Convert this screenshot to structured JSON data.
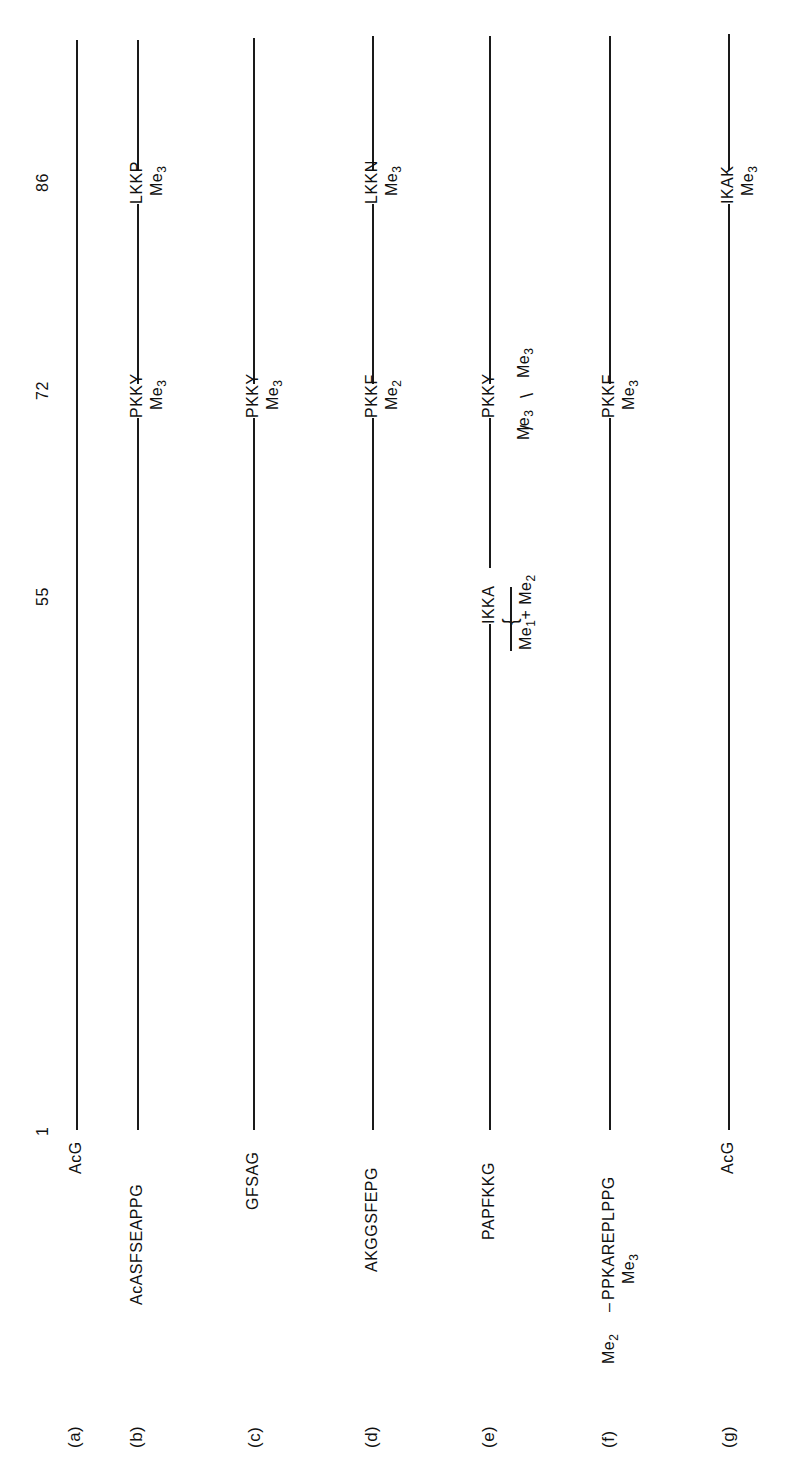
{
  "figure": {
    "positions": [
      {
        "label": "1",
        "y": 1128
      },
      {
        "label": "55",
        "y": 592
      },
      {
        "label": "72",
        "y": 386
      },
      {
        "label": "86",
        "y": 178
      }
    ],
    "rows": [
      {
        "id": "a",
        "label": "(a)",
        "n_term": "AcG",
        "x": 77,
        "sites": []
      },
      {
        "id": "b",
        "label": "(b)",
        "n_term": "AcASFSEAPPG",
        "x": 138,
        "sites": [
          {
            "pos": "72",
            "seq": "PKKY",
            "mod": "Me",
            "sub": "3"
          },
          {
            "pos": "86",
            "seq": "LKKP",
            "mod": "Me",
            "sub": "3"
          }
        ]
      },
      {
        "id": "c",
        "label": "(c)",
        "n_term": "GFSAG",
        "x": 254,
        "sites": [
          {
            "pos": "72",
            "seq": "PKKY",
            "mod": "Me",
            "sub": "3"
          }
        ]
      },
      {
        "id": "d",
        "label": "(d)",
        "n_term": "AKGGSFEPG",
        "x": 373,
        "sites": [
          {
            "pos": "72",
            "seq": "PKKF",
            "mod": "Me",
            "sub": "2"
          },
          {
            "pos": "86",
            "seq": "LKKN",
            "mod": "Me",
            "sub": "3"
          }
        ]
      },
      {
        "id": "e",
        "label": "(e)",
        "n_term": "PAPFKKG",
        "x": 490,
        "sites": [
          {
            "pos": "55",
            "seq": "IKKA",
            "mod_a": "Me",
            "sub_a": "1",
            "plus": "+",
            "mod_b": "Me",
            "sub_b": "2"
          },
          {
            "pos": "72",
            "seq": "PKKY",
            "mod_a": "Me",
            "sub_a": "3",
            "mod_b": "Me",
            "sub_b": "3"
          }
        ]
      },
      {
        "id": "f",
        "label": "(f)",
        "n_term": "PPKAREPLPPG",
        "n_prefix": "Me",
        "n_prefix_sub": "2",
        "n_dash": "–",
        "n_mod": "Me",
        "n_mod_sub": "3",
        "x": 610,
        "sites": [
          {
            "pos": "72",
            "seq": "PKKF",
            "mod": "Me",
            "sub": "3"
          }
        ]
      },
      {
        "id": "g",
        "label": "(g)",
        "n_term": "AcG",
        "x": 729,
        "sites": [
          {
            "pos": "86",
            "seq": "IKAK",
            "mod": "Me",
            "sub": "3"
          }
        ]
      }
    ]
  }
}
